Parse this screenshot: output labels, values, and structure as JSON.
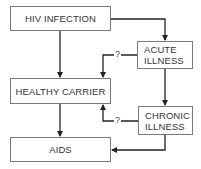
{
  "diagram": {
    "nodes": {
      "hiv_infection": {
        "label": "HIV INFECTION"
      },
      "acute_illness": {
        "line1": "ACUTE",
        "line2": "ILLNESS"
      },
      "healthy_carrier": {
        "label": "HEALTHY CARRIER"
      },
      "chronic_illness": {
        "line1": "CHRONIC",
        "line2": "ILLNESS"
      },
      "aids": {
        "label": "AIDS"
      }
    },
    "edges": [
      {
        "from": "HIV INFECTION",
        "to": "HEALTHY CARRIER",
        "label": ""
      },
      {
        "from": "HIV INFECTION",
        "to": "ACUTE ILLNESS",
        "label": ""
      },
      {
        "from": "ACUTE ILLNESS",
        "to": "HEALTHY CARRIER",
        "label": "?"
      },
      {
        "from": "ACUTE ILLNESS",
        "to": "CHRONIC ILLNESS",
        "label": ""
      },
      {
        "from": "HEALTHY CARRIER",
        "to": "AIDS",
        "label": ""
      },
      {
        "from": "CHRONIC ILLNESS",
        "to": "HEALTHY CARRIER",
        "label": "?"
      },
      {
        "from": "CHRONIC ILLNESS",
        "to": "AIDS",
        "label": ""
      }
    ],
    "uncertain_label_1": "?",
    "uncertain_label_2": "?",
    "colors": {
      "line": "#222222",
      "border": "#7a7a7a",
      "text": "#333333"
    }
  }
}
